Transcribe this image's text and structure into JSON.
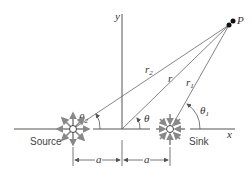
{
  "diagram": {
    "point_label": "P",
    "axis_x_label": "x",
    "axis_y_label": "y",
    "source_label": "Source",
    "sink_label": "Sink",
    "r_labels": {
      "r2": "r",
      "r2_sub": "2",
      "r": "r",
      "r1": "r",
      "r1_sub": "1"
    },
    "theta_labels": {
      "theta2": "θ",
      "theta2_sub": "2",
      "theta": "θ",
      "theta1": "θ",
      "theta1_sub": "1"
    },
    "dimension_labels": [
      "a",
      "a"
    ],
    "colors": {
      "line": "#555555",
      "arrow": "#888888",
      "point": "#111111"
    }
  }
}
